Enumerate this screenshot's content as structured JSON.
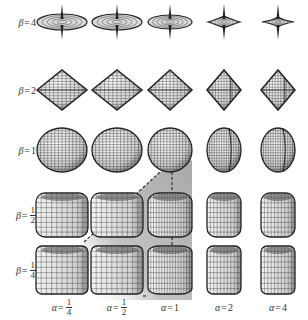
{
  "figure": {
    "row_param": "β",
    "col_param": "α",
    "rows": [
      {
        "label_var": "β",
        "eq": "=",
        "value": "4",
        "num": "",
        "den": "",
        "y": 22,
        "shape": "star-spike"
      },
      {
        "label_var": "β",
        "eq": "=",
        "value": "2",
        "num": "",
        "den": "",
        "y": 90,
        "shape": "octahedron"
      },
      {
        "label_var": "β",
        "eq": "=",
        "value": "1",
        "num": "",
        "den": "",
        "y": 150,
        "shape": "sphere"
      },
      {
        "label_var": "β",
        "eq": "=",
        "value": "",
        "num": "1",
        "den": "2",
        "y": 215,
        "shape": "rounded-box"
      },
      {
        "label_var": "β",
        "eq": "=",
        "value": "",
        "num": "1",
        "den": "4",
        "y": 270,
        "shape": "box"
      }
    ],
    "columns": [
      {
        "label_var": "α",
        "eq": "=",
        "value": "",
        "num": "1",
        "den": "4",
        "x": 62
      },
      {
        "label_var": "α",
        "eq": "=",
        "value": "",
        "num": "1",
        "den": "2",
        "x": 117
      },
      {
        "label_var": "α",
        "eq": "=",
        "value": "1",
        "num": "",
        "den": "",
        "x": 170
      },
      {
        "label_var": "α",
        "eq": "=",
        "value": "2",
        "num": "",
        "den": "",
        "x": 224
      },
      {
        "label_var": "α",
        "eq": "=",
        "value": "4",
        "num": "",
        "den": "",
        "x": 278
      }
    ],
    "highlight": {
      "description": "gray shaded region with dashed border from beta=1/4,alpha=1/4 corner up to alpha=1,beta=1 sphere",
      "fill_color": "#b8b8b8",
      "line_color": "#333333"
    },
    "colors": {
      "mesh": "#222222",
      "surface": "#e6e6e6",
      "label": "#333333"
    }
  }
}
